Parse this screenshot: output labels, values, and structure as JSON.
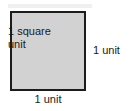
{
  "diagram": {
    "type": "geometry-unit-square",
    "shape": {
      "name": "square",
      "fill_color": "#d2d2d2",
      "border_color": "#1c1c1c",
      "interior_label_line1": "1 square",
      "interior_label_line2": "unit",
      "interior_label_full": "1 square unit"
    },
    "labels": {
      "right_side": "1 unit",
      "bottom_side": "1 unit"
    },
    "background_color": "#ffffff"
  }
}
